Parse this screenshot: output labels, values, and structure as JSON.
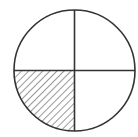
{
  "diagram": {
    "type": "fraction-circle",
    "parts_total": 4,
    "parts_shaded": 1,
    "shaded_quadrant": "bottom-left",
    "fill_pattern": "diagonal-hatch",
    "stroke_color": "#333333",
    "background_color": "#ffffff"
  }
}
